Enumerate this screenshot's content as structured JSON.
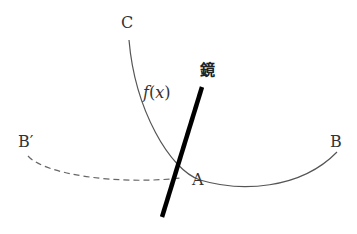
{
  "diagram": {
    "labels": {
      "C": "C",
      "fx_f": "f",
      "fx_x": "x",
      "fx_open": "(",
      "fx_close": ")",
      "mirror": "鏡",
      "A": "A",
      "B": "B",
      "B_prime": "B′"
    },
    "colors": {
      "curve": "#555555",
      "dashed": "#666666",
      "mirror": "#000000",
      "text": "#333333"
    }
  }
}
